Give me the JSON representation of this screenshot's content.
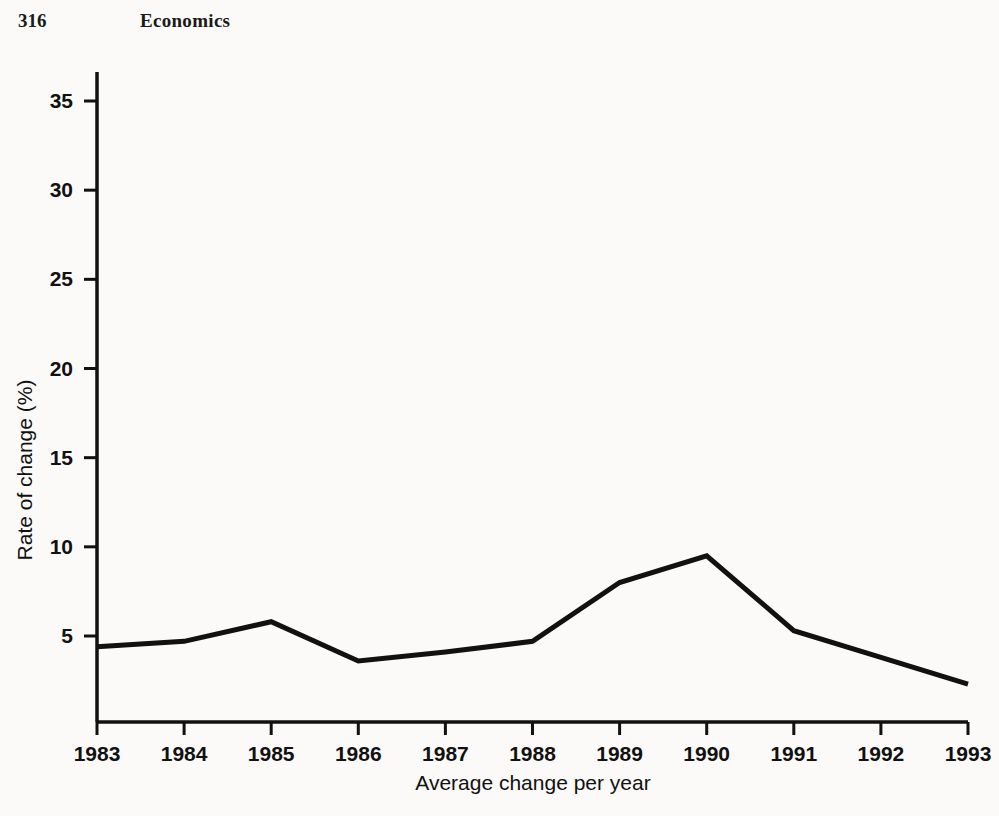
{
  "page": {
    "folio": "316",
    "chapter_title": "Economics",
    "background_color": "#fbfaf8",
    "ink_color": "#111111"
  },
  "bleed_through": {
    "note": "faint mirrored text showing through from the reverse side of the page",
    "top_block": "",
    "upper_block": "",
    "lower_block": ""
  },
  "chart_data": {
    "type": "line",
    "title": "",
    "xlabel": "Average change per year",
    "ylabel": "Rate of change (%)",
    "categories": [
      "1983",
      "1984",
      "1985",
      "1986",
      "1987",
      "1988",
      "1989",
      "1990",
      "1991",
      "1992",
      "1993"
    ],
    "x": [
      1983,
      1984,
      1985,
      1986,
      1987,
      1988,
      1989,
      1990,
      1991,
      1992,
      1993
    ],
    "values": [
      4.4,
      4.7,
      5.8,
      3.6,
      4.1,
      4.7,
      8.0,
      9.5,
      5.3,
      3.8,
      2.3
    ],
    "series": [
      {
        "name": "Rate of change",
        "values": [
          4.4,
          4.7,
          5.8,
          3.6,
          4.1,
          4.7,
          8.0,
          9.5,
          5.3,
          3.8,
          2.3
        ],
        "color": "#111111",
        "line_width": 5
      }
    ],
    "xlim": [
      1983,
      1993
    ],
    "ylim": [
      0,
      37
    ],
    "ytick_labels": [
      "5",
      "10",
      "15",
      "20",
      "25",
      "30",
      "35"
    ],
    "yticks": [
      5,
      10,
      15,
      20,
      25,
      30,
      35
    ],
    "xtick_labels": [
      "1983",
      "1984",
      "1985",
      "1986",
      "1987",
      "1988",
      "1989",
      "1990",
      "1991",
      "1992",
      "1993"
    ],
    "grid": false,
    "legend": false,
    "legend_position": "none",
    "markers": false,
    "annotations": []
  }
}
